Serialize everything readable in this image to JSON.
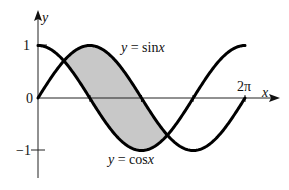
{
  "figure": {
    "labels": {
      "y_axis": "y",
      "x_axis": "x",
      "y_one": "1",
      "y_zero": "0",
      "y_neg_one": "−1",
      "two_pi": "2π",
      "sin_eq": "y = sin",
      "sin_var": "x",
      "cos_eq": "y = cos",
      "cos_var": "x"
    },
    "colors": {
      "curve": "#000000",
      "shade": "#c8c8c8",
      "axis": "#222222"
    }
  },
  "chart_data": {
    "type": "line",
    "title": "",
    "xlabel": "x",
    "ylabel": "y",
    "xlim": [
      0,
      6.2832
    ],
    "ylim": [
      -1,
      1
    ],
    "x_ticks": [
      "π/2",
      "π",
      "3π/2",
      "2π"
    ],
    "y_ticks": [
      "-1",
      "0",
      "1"
    ],
    "series": [
      {
        "name": "y = sin x",
        "function": "sin(x)",
        "domain": [
          0,
          6.2832
        ]
      },
      {
        "name": "y = cos x",
        "function": "cos(x)",
        "domain": [
          0,
          6.2832
        ]
      }
    ],
    "shaded_region": {
      "between": [
        "sin x",
        "cos x"
      ],
      "from": "π/4",
      "to": "5π/4"
    },
    "grid": false,
    "legend": "inline labels"
  }
}
